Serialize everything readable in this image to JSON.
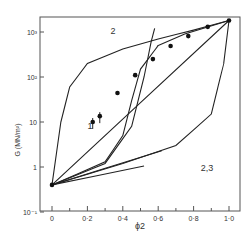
{
  "chart_data": {
    "type": "line",
    "title": "",
    "xlabel": "ϕ2",
    "ylabel": "G (MN/m²)",
    "xlim": [
      0,
      1.0
    ],
    "ylim": [
      0.1,
      1000
    ],
    "yscale": "log",
    "grid": false,
    "legend": "none (curves labelled inline)",
    "x_ticks": [
      "0",
      "0·2",
      "0·4",
      "0·6",
      "0·8",
      "1·0"
    ],
    "y_ticks": [
      "10⁻¹",
      "1",
      "10",
      "10²",
      "10³"
    ],
    "curve_labels": [
      {
        "text": "1",
        "x": 0.2,
        "y": 7
      },
      {
        "text": "2",
        "x": 0.33,
        "y": 900
      },
      {
        "text": "2,3",
        "x": 0.84,
        "y": 0.8
      }
    ],
    "series": [
      {
        "name": "experimental points",
        "kind": "scatter",
        "x": [
          0.0,
          0.23,
          0.27,
          0.37,
          0.47,
          0.57,
          0.67,
          0.77,
          0.88,
          1.0
        ],
        "y": [
          0.4,
          10,
          13.5,
          44,
          110,
          250,
          490,
          810,
          1300,
          1800
        ]
      },
      {
        "name": "1 (straight log-linear)",
        "kind": "line",
        "x": [
          0.0,
          1.0
        ],
        "y": [
          0.4,
          1800
        ]
      },
      {
        "name": "2 (upper bound)",
        "kind": "line",
        "x": [
          0.0,
          0.05,
          0.1,
          0.2,
          0.4,
          0.6,
          0.8,
          1.0
        ],
        "y": [
          0.4,
          10,
          60,
          200,
          420,
          700,
          1100,
          1800
        ]
      },
      {
        "name": "3 (lower bound)",
        "kind": "line",
        "x": [
          0.0,
          0.4,
          0.7,
          0.9,
          0.97,
          1.0
        ],
        "y": [
          0.4,
          1.2,
          3,
          15,
          200,
          1800
        ]
      },
      {
        "name": "intermediate S-curve A",
        "kind": "line",
        "x": [
          0.0,
          0.3,
          0.4,
          0.45,
          0.5,
          0.6,
          0.75,
          1.0
        ],
        "y": [
          0.4,
          1.3,
          5,
          30,
          150,
          500,
          900,
          1800
        ]
      },
      {
        "name": "intermediate S-curve B",
        "kind": "line",
        "x": [
          0.0,
          0.3,
          0.45,
          0.52,
          0.56,
          0.58
        ],
        "y": [
          0.4,
          1.2,
          8,
          100,
          600,
          1200
        ]
      },
      {
        "name": "initial slope 1",
        "kind": "line",
        "x": [
          0.0,
          0.62
        ],
        "y": [
          0.4,
          2.3
        ]
      },
      {
        "name": "initial slope 2",
        "kind": "line",
        "x": [
          0.0,
          0.52
        ],
        "y": [
          0.4,
          1.05
        ]
      }
    ]
  }
}
